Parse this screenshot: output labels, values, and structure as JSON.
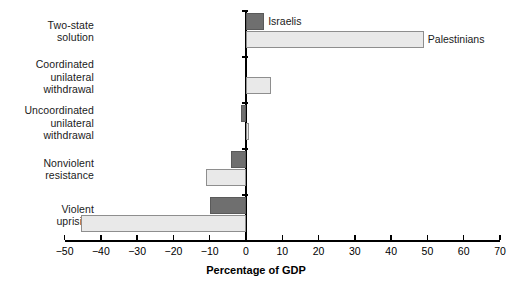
{
  "chart_data": {
    "type": "bar",
    "orientation": "horizontal",
    "title": "",
    "xlabel": "Percentage of GDP",
    "ylabel": "",
    "xlim": [
      -50,
      70
    ],
    "xticks": [
      -50,
      -40,
      -30,
      -20,
      -10,
      0,
      10,
      20,
      30,
      40,
      50,
      60,
      70
    ],
    "xtick_labels": [
      "−50",
      "−40",
      "−30",
      "−20",
      "−10",
      "0",
      "10",
      "20",
      "30",
      "40",
      "50",
      "60",
      "70"
    ],
    "grid": false,
    "legend_position": "inline-annotation",
    "categories": [
      "Two-state solution",
      "Coordinated unilateral withdrawal",
      "Uncoordinated unilateral withdrawal",
      "Nonviolent resistance",
      "Violent uprising"
    ],
    "category_label_lines": [
      [
        "Two-state",
        "solution"
      ],
      [
        "Coordinated",
        "unilateral",
        "withdrawal"
      ],
      [
        "Uncoordinated",
        "unilateral",
        "withdrawal"
      ],
      [
        "Nonviolent",
        "resistance"
      ],
      [
        "Violent",
        "uprising"
      ]
    ],
    "series": [
      {
        "name": "Israelis",
        "color": "#6f6f6f",
        "values": [
          5,
          0,
          -1.5,
          -4,
          -10
        ]
      },
      {
        "name": "Palestinians",
        "color": "#e9e9e9",
        "values": [
          49,
          7,
          0.8,
          -11,
          -45.5
        ]
      }
    ],
    "annotations": [
      {
        "text": "Israelis",
        "series": "Israelis",
        "category": "Two-state solution"
      },
      {
        "text": "Palestinians",
        "series": "Palestinians",
        "category": "Two-state solution"
      }
    ]
  },
  "axis": {
    "xlabel": "Percentage of GDP"
  }
}
